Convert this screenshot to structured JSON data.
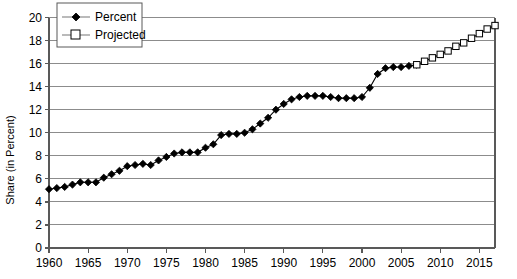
{
  "chart_data": {
    "type": "line",
    "title": "",
    "subtitle": "",
    "xlabel": "",
    "ylabel": "Share (in Percent)",
    "xlim": [
      1960,
      2017
    ],
    "ylim": [
      0,
      20
    ],
    "ytick_step": 2,
    "xtick_step": 5,
    "grid": true,
    "grid_axis": "y",
    "legend_position": "top-left",
    "x": [
      1960,
      1961,
      1962,
      1963,
      1964,
      1965,
      1966,
      1967,
      1968,
      1969,
      1970,
      1971,
      1972,
      1973,
      1974,
      1975,
      1976,
      1977,
      1978,
      1979,
      1980,
      1981,
      1982,
      1983,
      1984,
      1985,
      1986,
      1987,
      1988,
      1989,
      1990,
      1991,
      1992,
      1993,
      1994,
      1995,
      1996,
      1997,
      1998,
      1999,
      2000,
      2001,
      2002,
      2003,
      2004,
      2005,
      2006,
      2007,
      2008,
      2009,
      2010,
      2011,
      2012,
      2013,
      2014,
      2015,
      2016,
      2017
    ],
    "xticks": [
      1960,
      1965,
      1970,
      1975,
      1980,
      1985,
      1990,
      1995,
      2000,
      2005,
      2010,
      2015
    ],
    "xtick_labels": [
      "1960",
      "1965",
      "1970",
      "1975",
      "1980",
      "1985",
      "1990",
      "1995",
      "2000",
      "2005",
      "2010",
      "2015"
    ],
    "yticks": [
      0,
      2,
      4,
      6,
      8,
      10,
      12,
      14,
      16,
      18,
      20
    ],
    "ytick_labels": [
      "0",
      "2",
      "4",
      "6",
      "8",
      "10",
      "12",
      "14",
      "16",
      "18",
      "20"
    ],
    "series": [
      {
        "name": "Percent",
        "marker": "filled-diamond",
        "color": "#000000",
        "x": [
          1960,
          1961,
          1962,
          1963,
          1964,
          1965,
          1966,
          1967,
          1968,
          1969,
          1970,
          1971,
          1972,
          1973,
          1974,
          1975,
          1976,
          1977,
          1978,
          1979,
          1980,
          1981,
          1982,
          1983,
          1984,
          1985,
          1986,
          1987,
          1988,
          1989,
          1990,
          1991,
          1992,
          1993,
          1994,
          1995,
          1996,
          1997,
          1998,
          1999,
          2000,
          2001,
          2002,
          2003,
          2004,
          2005,
          2006,
          2007
        ],
        "values": [
          5.1,
          5.2,
          5.3,
          5.5,
          5.7,
          5.7,
          5.7,
          6.1,
          6.4,
          6.7,
          7.1,
          7.2,
          7.3,
          7.2,
          7.6,
          7.9,
          8.2,
          8.3,
          8.3,
          8.3,
          8.7,
          9.0,
          9.8,
          9.9,
          9.9,
          10.0,
          10.3,
          10.8,
          11.3,
          12.0,
          12.5,
          12.9,
          13.1,
          13.2,
          13.2,
          13.2,
          13.1,
          13.0,
          13.0,
          13.0,
          13.1,
          13.9,
          15.1,
          15.6,
          15.7,
          15.7,
          15.8,
          15.9
        ]
      },
      {
        "name": "Projected",
        "marker": "open-square",
        "color": "#000000",
        "x": [
          2007,
          2008,
          2009,
          2010,
          2011,
          2012,
          2013,
          2014,
          2015,
          2016,
          2017
        ],
        "values": [
          15.9,
          16.2,
          16.5,
          16.8,
          17.1,
          17.5,
          17.8,
          18.2,
          18.6,
          19.0,
          19.3
        ]
      }
    ]
  },
  "legend": {
    "entries": [
      {
        "label": "Percent",
        "marker": "filled-diamond"
      },
      {
        "label": "Projected",
        "marker": "open-square"
      }
    ]
  },
  "axes": {
    "y_title": "Share (in Percent)"
  }
}
